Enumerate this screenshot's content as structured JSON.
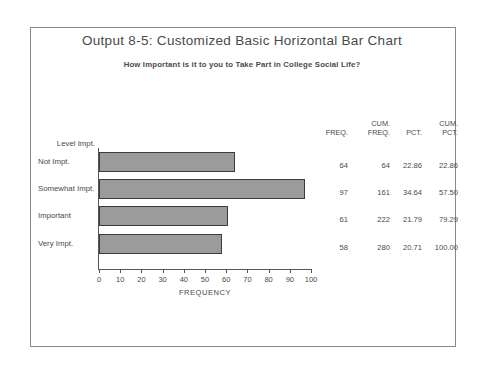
{
  "title": "Output 8-5:  Customized Basic Horizontal Bar Chart",
  "subtitle": "How Important is it to you to Take Part in College Social Life?",
  "axis": {
    "x_title": "FREQUENCY",
    "x_ticks": [
      "0",
      "10",
      "20",
      "30",
      "40",
      "50",
      "60",
      "70",
      "80",
      "90",
      "100"
    ]
  },
  "category_header": "Level Impt.",
  "table": {
    "headers": [
      {
        "line1": "",
        "line2": "FREQ."
      },
      {
        "line1": "CUM.",
        "line2": "FREQ."
      },
      {
        "line1": "",
        "line2": "PCT."
      },
      {
        "line1": "CUM.",
        "line2": "PCT."
      }
    ],
    "rows": [
      {
        "label": "Not Impt.",
        "freq": "64",
        "cum_freq": "64",
        "pct": "22.86",
        "cum_pct": "22.86"
      },
      {
        "label": "Somewhat Impt.",
        "freq": "97",
        "cum_freq": "161",
        "pct": "34.64",
        "cum_pct": "57.50"
      },
      {
        "label": "Important",
        "freq": "61",
        "cum_freq": "222",
        "pct": "21.79",
        "cum_pct": "79.29"
      },
      {
        "label": "Very Impt.",
        "freq": "58",
        "cum_freq": "280",
        "pct": "20.71",
        "cum_pct": "100.00"
      }
    ]
  },
  "colors": {
    "bar_fill": "#9b9b9b",
    "bar_border": "#3c3c3c",
    "frame": "#8a8a8a",
    "text": "#4a4a4a"
  },
  "chart_data": {
    "type": "bar",
    "orientation": "horizontal",
    "title": "Output 8-5:  Customized Basic Horizontal Bar Chart",
    "subtitle": "How Important is it to you to Take Part in College Social Life?",
    "xlabel": "FREQUENCY",
    "ylabel": "Level Impt.",
    "categories": [
      "Not Impt.",
      "Somewhat Impt.",
      "Important",
      "Very Impt."
    ],
    "values": [
      64,
      97,
      61,
      58
    ],
    "xlim": [
      0,
      100
    ],
    "xticks": [
      0,
      10,
      20,
      30,
      40,
      50,
      60,
      70,
      80,
      90,
      100
    ],
    "grid": false,
    "legend": false,
    "cumulative_frequency": [
      64,
      161,
      222,
      280
    ],
    "percent": [
      22.86,
      34.64,
      21.79,
      20.71
    ],
    "cumulative_percent": [
      22.86,
      57.5,
      79.29,
      100.0
    ],
    "total": 280
  }
}
